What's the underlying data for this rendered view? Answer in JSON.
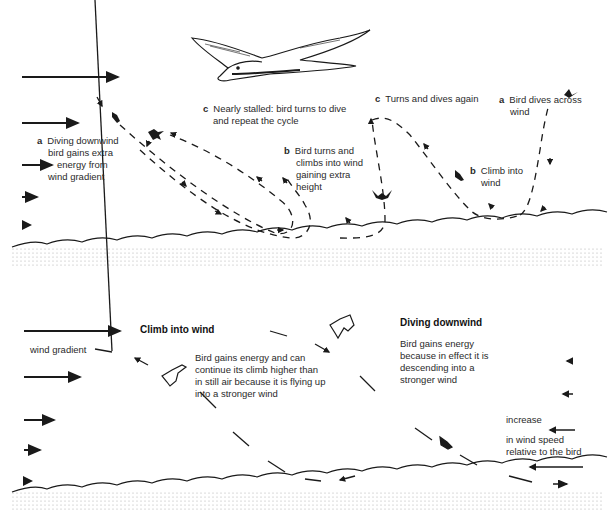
{
  "top_panel": {
    "title": "Dynamic soaring cycle over waves",
    "labels": {
      "a_left": {
        "key": "a",
        "lines": [
          "Diving downwind",
          "bird gains extra",
          "energy from",
          "wind gradient"
        ]
      },
      "c_middle": {
        "key": "c",
        "lines": [
          "Nearly stalled: bird turns to dive",
          "and repeat the cycle"
        ]
      },
      "b_middle": {
        "key": "b",
        "lines": [
          "Bird turns and",
          "climbs into wind",
          "gaining extra",
          "height"
        ]
      },
      "c_right": {
        "key": "c",
        "lines": [
          "Turns and dives again"
        ]
      },
      "a_right": {
        "key": "a",
        "lines": [
          "Bird dives across",
          "wind"
        ]
      },
      "b_right": {
        "key": "b",
        "lines": [
          "Climb into",
          "wind"
        ]
      }
    },
    "wind_arrows": [
      "strongest",
      "strong",
      "medium",
      "weak",
      "weakest"
    ]
  },
  "bottom_panel": {
    "climb_heading": "Climb into wind",
    "wind_gradient_label": "wind gradient",
    "climb_text": [
      "Bird gains energy and can",
      "continue its climb higher than",
      "in still air because it is flying up",
      "into a stronger wind"
    ],
    "dive_heading": "Diving downwind",
    "dive_text": [
      "Bird gains energy",
      "because in effect it is",
      "descending into a",
      "stronger wind"
    ],
    "relative_text": [
      "increase",
      "in wind speed",
      "relative to the bird"
    ]
  },
  "colors": {
    "ink": "#1a1a1a",
    "sea_dots": "#9a9a9a",
    "background": "#ffffff"
  }
}
